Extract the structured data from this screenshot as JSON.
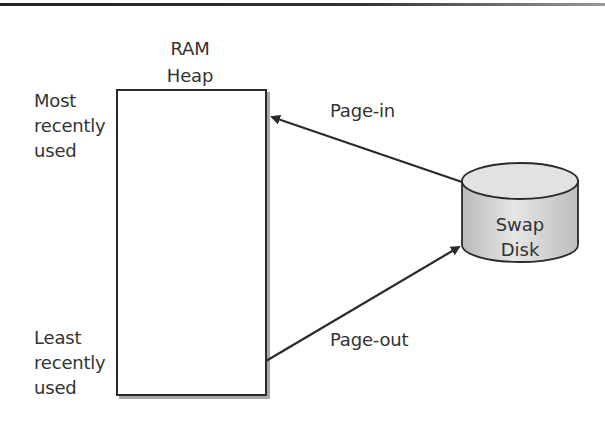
{
  "diagram": {
    "ram_heap": {
      "title_line1": "RAM",
      "title_line2": "Heap"
    },
    "labels": {
      "most_recent": [
        "Most",
        "recently",
        "used"
      ],
      "least_recent": [
        "Least",
        "recently",
        "used"
      ]
    },
    "arrows": {
      "page_in": "Page-in",
      "page_out": "Page-out"
    },
    "swap_disk": {
      "line1": "Swap",
      "line2": "Disk"
    },
    "colors": {
      "stroke": "#2a2a2a",
      "shadow": "#a8a8a8",
      "disk_fill": "#cfcfcf",
      "disk_top": "#e4e4e4"
    }
  }
}
